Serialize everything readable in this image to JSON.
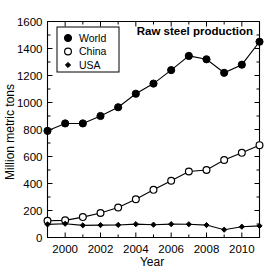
{
  "chart_data": {
    "type": "line",
    "title": "Raw steel production",
    "xlabel": "Year",
    "ylabel": "Million metric tons",
    "x": [
      1999,
      2000,
      2001,
      2002,
      2003,
      2004,
      2005,
      2006,
      2007,
      2008,
      2009,
      2010,
      2011
    ],
    "xlim": [
      1999,
      2011
    ],
    "ylim": [
      0,
      1600
    ],
    "xticks": [
      2000,
      2002,
      2004,
      2006,
      2008,
      2010
    ],
    "xtick_labels": [
      "2000",
      "2002",
      "2004",
      "2006",
      "2008",
      "2010"
    ],
    "xminor_ticks": [
      1999,
      2001,
      2003,
      2005,
      2007,
      2009,
      2011
    ],
    "yticks": [
      0,
      200,
      400,
      600,
      800,
      1000,
      1200,
      1400,
      1600
    ],
    "ytick_labels": [
      "0",
      "200",
      "400",
      "600",
      "800",
      "1000",
      "1200",
      "1400",
      "1600"
    ],
    "yminor_step": 100,
    "grid": false,
    "legend_position": "upper-left",
    "series": [
      {
        "name": "World",
        "marker": "filled-circle",
        "values": [
          790,
          845,
          845,
          900,
          965,
          1065,
          1140,
          1240,
          1345,
          1320,
          1220,
          1280,
          1450
        ]
      },
      {
        "name": "China",
        "marker": "open-circle",
        "values": [
          124,
          127,
          151,
          182,
          222,
          283,
          353,
          420,
          489,
          500,
          574,
          627,
          684
        ]
      },
      {
        "name": "USA",
        "marker": "small-filled-diamond",
        "values": [
          97,
          102,
          90,
          92,
          93,
          99,
          95,
          99,
          98,
          92,
          58,
          80,
          86
        ]
      }
    ]
  },
  "legend": {
    "entries": [
      {
        "label": "World",
        "marker": "filled-circle"
      },
      {
        "label": "China",
        "marker": "open-circle"
      },
      {
        "label": "USA",
        "marker": "small-filled-diamond"
      }
    ]
  },
  "colors": {
    "foreground": "#000000",
    "background": "#ffffff"
  }
}
